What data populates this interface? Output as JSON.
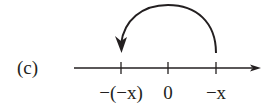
{
  "figure": {
    "label": "(c)",
    "ticks": [
      {
        "label": "−(−x)",
        "x": 121
      },
      {
        "label": "0",
        "x": 168
      },
      {
        "label": "−x",
        "x": 216
      }
    ],
    "arc": {
      "from": "−x",
      "to": "−(−x)",
      "direction": "leftward-over-top"
    },
    "colors": {
      "ink": "#231f20",
      "background": "#ffffff"
    }
  }
}
